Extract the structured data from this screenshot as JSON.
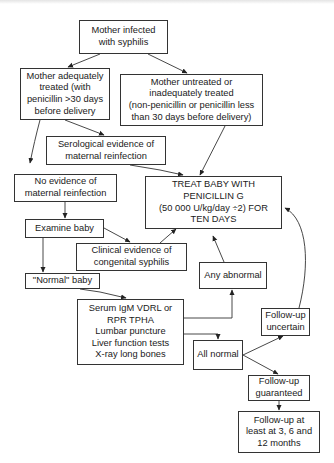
{
  "diagram": {
    "type": "flowchart",
    "nodes": {
      "mother_infected": "Mother infected\nwith syphilis",
      "adequately_treated": "Mother adequately\ntreated (with\npenicillin >30 days\nbefore delivery",
      "untreated": "Mother untreated or\ninadequately treated\n(non-penicillin or penicillin less\nthan 30 days before delivery)",
      "serological_evidence": "Serological evidence of\nmaternal reinfection",
      "no_evidence": "No evidence of\nmaternal reinfection",
      "treat_baby": "TREAT BABY WITH\nPENICILLIN G\n(50 000 U/kg/day ÷2) FOR\nTEN DAYS",
      "examine_baby": "Examine baby",
      "clinical_evidence": "Clinical evidence of\ncongenital syphilis",
      "any_abnormal": "Any abnormal",
      "normal_baby": "\"Normal\" baby",
      "tests": "Serum IgM VDRL or\nRPR TPHA\nLumbar puncture\nLiver function tests\nX-ray long bones",
      "all_normal": "All normal",
      "followup_uncertain": "Follow-up\nuncertain",
      "followup_guaranteed": "Follow-up\nguaranteed",
      "followup_schedule": "Follow-up at\nleast at 3, 6 and\n12 months"
    },
    "edges": [
      [
        "mother_infected",
        "adequately_treated"
      ],
      [
        "mother_infected",
        "untreated"
      ],
      [
        "adequately_treated",
        "serological_evidence"
      ],
      [
        "adequately_treated",
        "no_evidence"
      ],
      [
        "untreated",
        "treat_baby"
      ],
      [
        "serological_evidence",
        "treat_baby"
      ],
      [
        "no_evidence",
        "examine_baby"
      ],
      [
        "examine_baby",
        "clinical_evidence"
      ],
      [
        "examine_baby",
        "normal_baby"
      ],
      [
        "clinical_evidence",
        "treat_baby"
      ],
      [
        "normal_baby",
        "tests"
      ],
      [
        "tests",
        "any_abnormal"
      ],
      [
        "tests",
        "all_normal"
      ],
      [
        "any_abnormal",
        "treat_baby"
      ],
      [
        "all_normal",
        "followup_uncertain"
      ],
      [
        "all_normal",
        "followup_guaranteed"
      ],
      [
        "followup_uncertain",
        "treat_baby"
      ],
      [
        "followup_guaranteed",
        "followup_schedule"
      ]
    ]
  }
}
